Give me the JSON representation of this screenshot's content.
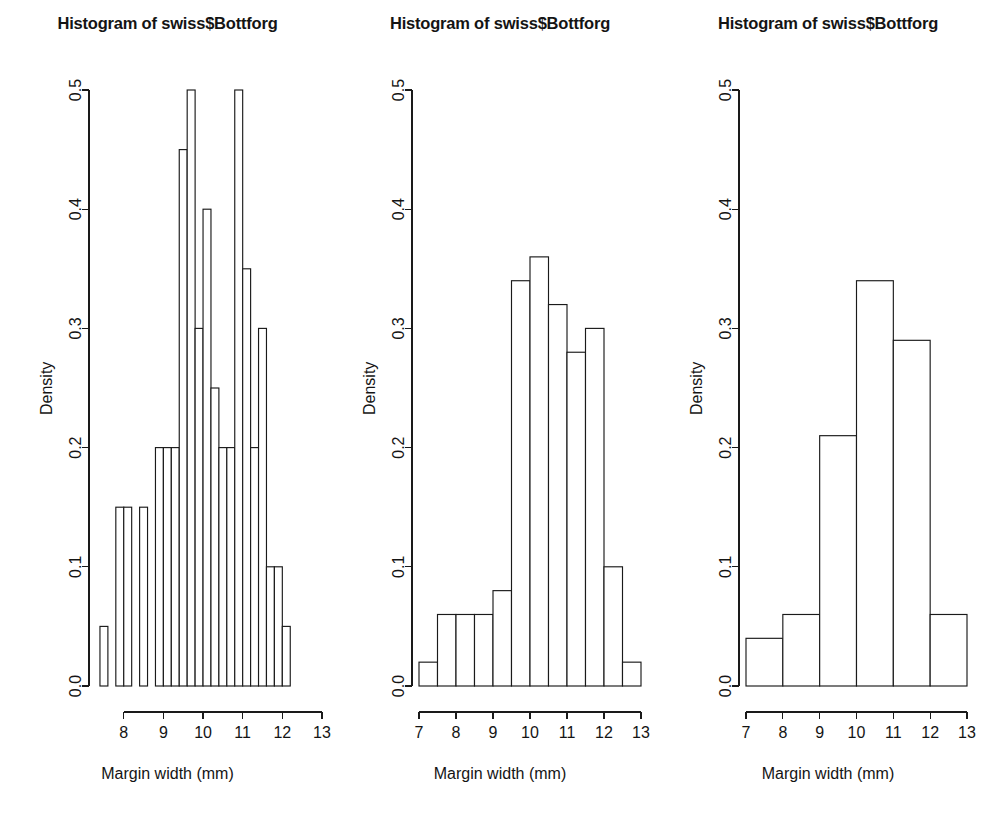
{
  "figure": {
    "background": "#ffffff",
    "ink_color": "#1a1a1a",
    "panel_count": 3
  },
  "panels": [
    {
      "id": "panel-1",
      "title": "Histogram of swiss$Bottforg",
      "xlabel": "Margin width (mm)",
      "ylabel": "Density",
      "x_ticks": [
        "8",
        "9",
        "10",
        "11",
        "12",
        "13"
      ],
      "y_ticks": [
        "0.0",
        "0.1",
        "0.2",
        "0.3",
        "0.4",
        "0.5"
      ]
    },
    {
      "id": "panel-2",
      "title": "Histogram of swiss$Bottforg",
      "xlabel": "Margin width (mm)",
      "ylabel": "Density",
      "x_ticks": [
        "7",
        "8",
        "9",
        "10",
        "11",
        "12",
        "13"
      ],
      "y_ticks": [
        "0.0",
        "0.1",
        "0.2",
        "0.3",
        "0.4",
        "0.5"
      ]
    },
    {
      "id": "panel-3",
      "title": "Histogram of swiss$Bottforg",
      "xlabel": "Margin width (mm)",
      "ylabel": "Density",
      "x_ticks": [
        "7",
        "8",
        "9",
        "10",
        "11",
        "12",
        "13"
      ],
      "y_ticks": [
        "0.0",
        "0.1",
        "0.2",
        "0.3",
        "0.4",
        "0.5"
      ]
    }
  ],
  "chart_data": [
    {
      "type": "bar",
      "title": "Histogram of swiss$Bottforg",
      "xlabel": "Margin width (mm)",
      "ylabel": "Density",
      "xlim": [
        7.3,
        12.9
      ],
      "ylim": [
        0.0,
        0.5
      ],
      "xticks": [
        8,
        9,
        10,
        11,
        12,
        13
      ],
      "yticks": [
        0.0,
        0.1,
        0.2,
        0.3,
        0.4,
        0.5
      ],
      "grid": false,
      "legend": "none",
      "bin_width": 0.2,
      "bin_edges": [
        7.4,
        7.6,
        7.8,
        8.0,
        8.2,
        8.4,
        8.6,
        8.8,
        9.0,
        9.2,
        9.4,
        9.6,
        9.8,
        10.0,
        10.2,
        10.4,
        10.6,
        10.8,
        11.0,
        11.2,
        11.4,
        11.6,
        11.8,
        12.0,
        12.2,
        12.4,
        12.6,
        12.8
      ],
      "values": [
        0.05,
        0.0,
        0.15,
        0.15,
        0.0,
        0.15,
        0.0,
        0.2,
        0.2,
        0.2,
        0.45,
        0.5,
        0.3,
        0.4,
        0.25,
        0.2,
        0.2,
        0.5,
        0.35,
        0.2,
        0.3,
        0.1,
        0.1,
        0.05
      ]
    },
    {
      "type": "bar",
      "title": "Histogram of swiss$Bottforg",
      "xlabel": "Margin width (mm)",
      "ylabel": "Density",
      "xlim": [
        7.0,
        13.0
      ],
      "ylim": [
        0.0,
        0.5
      ],
      "xticks": [
        7,
        8,
        9,
        10,
        11,
        12,
        13
      ],
      "yticks": [
        0.0,
        0.1,
        0.2,
        0.3,
        0.4,
        0.5
      ],
      "grid": false,
      "legend": "none",
      "bin_width": 0.5,
      "bin_edges": [
        7.0,
        7.5,
        8.0,
        8.5,
        9.0,
        9.5,
        10.0,
        10.5,
        11.0,
        11.5,
        12.0,
        12.5,
        13.0
      ],
      "values": [
        0.02,
        0.06,
        0.06,
        0.06,
        0.08,
        0.34,
        0.36,
        0.32,
        0.28,
        0.3,
        0.1,
        0.02
      ]
    },
    {
      "type": "bar",
      "title": "Histogram of swiss$Bottforg",
      "xlabel": "Margin width (mm)",
      "ylabel": "Density",
      "xlim": [
        7.0,
        13.0
      ],
      "ylim": [
        0.0,
        0.5
      ],
      "xticks": [
        7,
        8,
        9,
        10,
        11,
        12,
        13
      ],
      "yticks": [
        0.0,
        0.1,
        0.2,
        0.3,
        0.4,
        0.5
      ],
      "grid": false,
      "legend": "none",
      "bin_width": 1.0,
      "bin_edges": [
        7,
        8,
        9,
        10,
        11,
        12,
        13
      ],
      "values": [
        0.04,
        0.06,
        0.21,
        0.34,
        0.29,
        0.06
      ]
    }
  ]
}
